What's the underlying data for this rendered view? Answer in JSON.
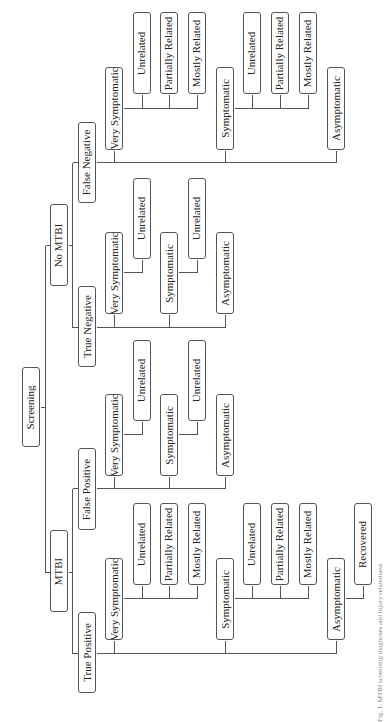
{
  "diagram": {
    "caption": "Fig. 1. MTBI screening diagnoses and injury relatedness",
    "colors": {
      "line": "#555555",
      "box_border": "#555555",
      "text": "#222222"
    },
    "nodes": [
      {
        "id": "screening",
        "label": "Screening",
        "x": 22,
        "y": 367,
        "w": 18,
        "h": 80
      },
      {
        "id": "no-mtbi",
        "label": "No MTBI",
        "x": 50,
        "y": 204,
        "w": 18,
        "h": 82
      },
      {
        "id": "mtbi",
        "label": "MTBI",
        "x": 50,
        "y": 530,
        "w": 18,
        "h": 82
      },
      {
        "id": "false-negative",
        "label": "False Negative",
        "x": 78,
        "y": 122,
        "w": 18,
        "h": 81
      },
      {
        "id": "true-negative",
        "label": "True Negative",
        "x": 78,
        "y": 286,
        "w": 18,
        "h": 81
      },
      {
        "id": "false-positive",
        "label": "False Positive",
        "x": 78,
        "y": 448,
        "w": 18,
        "h": 82
      },
      {
        "id": "true-positive",
        "label": "True Positive",
        "x": 78,
        "y": 612,
        "w": 18,
        "h": 81
      },
      {
        "id": "fn-very",
        "label": "Very Symptomatic",
        "x": 105,
        "y": 67,
        "w": 18,
        "h": 83
      },
      {
        "id": "fn-very-unrel",
        "label": "Unrelated",
        "x": 133,
        "y": 12,
        "w": 18,
        "h": 82
      },
      {
        "id": "fn-very-part",
        "label": "Partially Related",
        "x": 160,
        "y": 12,
        "w": 18,
        "h": 82
      },
      {
        "id": "fn-very-most",
        "label": "Mostly Related",
        "x": 188,
        "y": 12,
        "w": 18,
        "h": 82
      },
      {
        "id": "fn-sym",
        "label": "Symptomatic",
        "x": 216,
        "y": 67,
        "w": 18,
        "h": 83
      },
      {
        "id": "fn-sym-unrel",
        "label": "Unrelated",
        "x": 243,
        "y": 12,
        "w": 18,
        "h": 82
      },
      {
        "id": "fn-sym-part",
        "label": "Partially Related",
        "x": 271,
        "y": 12,
        "w": 18,
        "h": 82
      },
      {
        "id": "fn-sym-most",
        "label": "Mostly Related",
        "x": 299,
        "y": 12,
        "w": 18,
        "h": 82
      },
      {
        "id": "fn-asym",
        "label": "Asymptomatic",
        "x": 327,
        "y": 67,
        "w": 18,
        "h": 83
      },
      {
        "id": "tn-very",
        "label": "Very Symptomatic",
        "x": 105,
        "y": 232,
        "w": 18,
        "h": 82
      },
      {
        "id": "tn-very-unrel",
        "label": "Unrelated",
        "x": 133,
        "y": 178,
        "w": 18,
        "h": 81
      },
      {
        "id": "tn-sym",
        "label": "Symptomatic",
        "x": 160,
        "y": 232,
        "w": 18,
        "h": 82
      },
      {
        "id": "tn-sym-unrel",
        "label": "Unrelated",
        "x": 188,
        "y": 178,
        "w": 18,
        "h": 81
      },
      {
        "id": "tn-asym",
        "label": "Asymptomatic",
        "x": 216,
        "y": 232,
        "w": 18,
        "h": 82
      },
      {
        "id": "fp-very",
        "label": "Very Symptomatic",
        "x": 105,
        "y": 394,
        "w": 18,
        "h": 82
      },
      {
        "id": "fp-very-unrel",
        "label": "Unrelated",
        "x": 133,
        "y": 340,
        "w": 18,
        "h": 81
      },
      {
        "id": "fp-sym",
        "label": "Symptomatic",
        "x": 160,
        "y": 394,
        "w": 18,
        "h": 82
      },
      {
        "id": "fp-sym-unrel",
        "label": "Unrelated",
        "x": 188,
        "y": 340,
        "w": 18,
        "h": 81
      },
      {
        "id": "fp-asym",
        "label": "Asymptomatic",
        "x": 216,
        "y": 394,
        "w": 18,
        "h": 82
      },
      {
        "id": "tp-very",
        "label": "Very Symptomatic",
        "x": 105,
        "y": 558,
        "w": 18,
        "h": 82
      },
      {
        "id": "tp-very-unrel",
        "label": "Unrelated",
        "x": 133,
        "y": 503,
        "w": 18,
        "h": 82
      },
      {
        "id": "tp-very-part",
        "label": "Partially Related",
        "x": 160,
        "y": 503,
        "w": 18,
        "h": 82
      },
      {
        "id": "tp-very-most",
        "label": "Mostly Related",
        "x": 188,
        "y": 503,
        "w": 18,
        "h": 82
      },
      {
        "id": "tp-sym",
        "label": "Symptomatic",
        "x": 216,
        "y": 558,
        "w": 18,
        "h": 82
      },
      {
        "id": "tp-sym-unrel",
        "label": "Unrelated",
        "x": 243,
        "y": 503,
        "w": 18,
        "h": 82
      },
      {
        "id": "tp-sym-part",
        "label": "Partially Related",
        "x": 271,
        "y": 503,
        "w": 18,
        "h": 82
      },
      {
        "id": "tp-sym-most",
        "label": "Mostly Related",
        "x": 299,
        "y": 503,
        "w": 18,
        "h": 82
      },
      {
        "id": "tp-asym",
        "label": "Asymptomatic",
        "x": 327,
        "y": 558,
        "w": 18,
        "h": 82
      },
      {
        "id": "tp-asym-recov",
        "label": "Recovered",
        "x": 354,
        "y": 503,
        "w": 18,
        "h": 82
      }
    ],
    "lines": [
      [
        40,
        407,
        45,
        407
      ],
      [
        45,
        245,
        45,
        572
      ],
      [
        45,
        245,
        50,
        245
      ],
      [
        45,
        572,
        50,
        572
      ],
      [
        68,
        245,
        72,
        245
      ],
      [
        72,
        162,
        72,
        327
      ],
      [
        72,
        162,
        78,
        162
      ],
      [
        72,
        327,
        78,
        327
      ],
      [
        68,
        572,
        72,
        572
      ],
      [
        72,
        488,
        72,
        653
      ],
      [
        72,
        488,
        78,
        488
      ],
      [
        72,
        653,
        78,
        653
      ],
      [
        96,
        162,
        336,
        162
      ],
      [
        114,
        150,
        114,
        162
      ],
      [
        225,
        150,
        225,
        162
      ],
      [
        336,
        150,
        336,
        162
      ],
      [
        123,
        108,
        197,
        108
      ],
      [
        142,
        94,
        142,
        108
      ],
      [
        169,
        94,
        169,
        108
      ],
      [
        197,
        94,
        197,
        108
      ],
      [
        234,
        108,
        308,
        108
      ],
      [
        252,
        94,
        252,
        108
      ],
      [
        280,
        94,
        280,
        108
      ],
      [
        308,
        94,
        308,
        108
      ],
      [
        96,
        327,
        225,
        327
      ],
      [
        114,
        314,
        114,
        327
      ],
      [
        169,
        314,
        169,
        327
      ],
      [
        225,
        314,
        225,
        327
      ],
      [
        123,
        272,
        142,
        272
      ],
      [
        142,
        259,
        142,
        272
      ],
      [
        178,
        272,
        197,
        272
      ],
      [
        197,
        259,
        197,
        272
      ],
      [
        96,
        488,
        225,
        488
      ],
      [
        114,
        476,
        114,
        488
      ],
      [
        169,
        476,
        169,
        488
      ],
      [
        225,
        476,
        225,
        488
      ],
      [
        123,
        434,
        142,
        434
      ],
      [
        142,
        421,
        142,
        434
      ],
      [
        178,
        434,
        197,
        434
      ],
      [
        197,
        421,
        197,
        434
      ],
      [
        96,
        653,
        336,
        653
      ],
      [
        114,
        640,
        114,
        653
      ],
      [
        225,
        640,
        225,
        653
      ],
      [
        336,
        640,
        336,
        653
      ],
      [
        123,
        598,
        197,
        598
      ],
      [
        142,
        585,
        142,
        598
      ],
      [
        169,
        585,
        169,
        598
      ],
      [
        197,
        585,
        197,
        598
      ],
      [
        234,
        598,
        308,
        598
      ],
      [
        252,
        585,
        252,
        598
      ],
      [
        280,
        585,
        280,
        598
      ],
      [
        308,
        585,
        308,
        598
      ],
      [
        345,
        598,
        363,
        598
      ],
      [
        363,
        585,
        363,
        598
      ]
    ]
  }
}
